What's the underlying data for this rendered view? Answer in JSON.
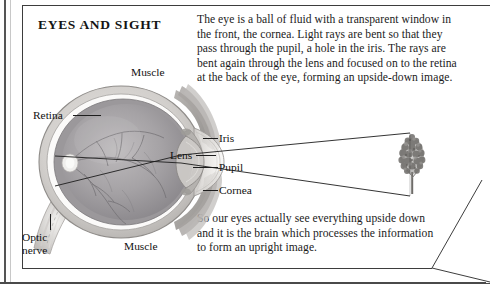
{
  "page": {
    "title": "EYES AND SIGHT"
  },
  "body": {
    "paragraph_1": "The eye is a ball of fluid with a transparent window in the front, the cornea. Light rays are bent so that they pass through the pupil, a hole in the iris. The rays are bent again through the lens and focused on to the retina at the back of the eye, forming an upside-down image.",
    "paragraph_2": "So our eyes actually see everything upside down and it is the brain which processes the information to form an upright image."
  },
  "diagram": {
    "name": "eye-cross-section",
    "labels": {
      "retina": "Retina",
      "muscle_top": "Muscle",
      "muscle_bottom": "Muscle",
      "optic_nerve": "Optic nerve",
      "iris": "Iris",
      "lens": "Lens",
      "pupil": "Pupil",
      "cornea": "Cornea"
    },
    "object_viewed": "tree"
  },
  "colors": {
    "ink": "#1a1a1a",
    "rule": "#3d3d3d",
    "gutter": "#555555",
    "sclera": "#d8d5d2",
    "vitreous": "#a9a6a8",
    "choroid": "#8e8b8f",
    "ray": "#1d1d1d",
    "foliage": "#8f8d8b"
  }
}
